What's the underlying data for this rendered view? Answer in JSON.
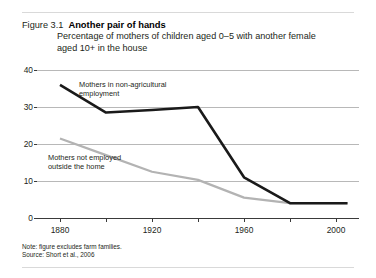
{
  "figure": {
    "number": "Figure 3.1",
    "title": "Another pair of hands",
    "subtitle_line1": "Percentage of mothers of children aged 0–5 with another female",
    "subtitle_line2": "aged 10+ in the house",
    "note": "Note: figure excludes farm families.",
    "source": "Source: Short et al., 2006"
  },
  "chart_data": {
    "type": "line",
    "title": "Another pair of hands",
    "subtitle": "Percentage of mothers of children aged 0–5 with another female aged 10+ in the house",
    "xlabel": "",
    "ylabel": "",
    "xlim": [
      1870,
      2010
    ],
    "ylim": [
      0,
      40
    ],
    "yticks": [
      0,
      10,
      20,
      30,
      40
    ],
    "ytick_labels": [
      "0",
      "10",
      "20",
      "30",
      "40"
    ],
    "xticks": [
      1880,
      1900,
      1920,
      1940,
      1960,
      1980,
      2000
    ],
    "xtick_labels": [
      "1880",
      "",
      "1920",
      "",
      "1960",
      "",
      "2000"
    ],
    "grid": true,
    "legend": "inline-annotations",
    "series": [
      {
        "name": "Mothers in non-agricultural employment",
        "color": "#1a1a1a",
        "x": [
          1880,
          1900,
          1920,
          1940,
          1960,
          1980,
          2000,
          2005
        ],
        "values": [
          36,
          28.5,
          29.2,
          30,
          11,
          4,
          4,
          4
        ]
      },
      {
        "name": "Mothers not employed outside the home",
        "color": "#b3b3b3",
        "x": [
          1880,
          1900,
          1920,
          1940,
          1960,
          1980,
          2000,
          2005
        ],
        "values": [
          21.5,
          17,
          12.5,
          10.3,
          5.5,
          4,
          4,
          4
        ]
      }
    ],
    "annotations": [
      {
        "text_line1": "Mothers in non-agricultural",
        "text_line2": "employment",
        "series": "Mothers in non-agricultural employment"
      },
      {
        "text_line1": "Mothers not employed",
        "text_line2": "outside the home",
        "series": "Mothers not employed outside the home"
      }
    ]
  }
}
